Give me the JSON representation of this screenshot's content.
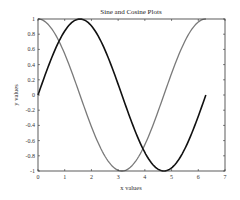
{
  "chart_data": {
    "type": "line",
    "title": "Sine and Cosine Plots",
    "xlabel": "x values",
    "ylabel": "y values",
    "xlim": [
      0,
      7
    ],
    "ylim": [
      -1,
      1
    ],
    "xticks": [
      0,
      1,
      2,
      3,
      4,
      5,
      6,
      7
    ],
    "yticks": [
      -1,
      -0.8,
      -0.6,
      -0.4,
      -0.2,
      0,
      0.2,
      0.4,
      0.6,
      0.8,
      1
    ],
    "ytick_labels": [
      "-1",
      "-0.8",
      "-0.6",
      "-0.4",
      "-0.2",
      "0",
      "0.2",
      "0.4",
      "0.6",
      "0.8",
      "1"
    ],
    "grid": false,
    "legend": null,
    "series": [
      {
        "name": "sin(x)",
        "color": "#111111",
        "width": 1.6,
        "x_range": [
          0,
          6.2832
        ],
        "function": "sin"
      },
      {
        "name": "cos(x)",
        "color": "#7a7a7a",
        "width": 1.3,
        "x_range": [
          0,
          6.2832
        ],
        "function": "cos"
      }
    ]
  }
}
